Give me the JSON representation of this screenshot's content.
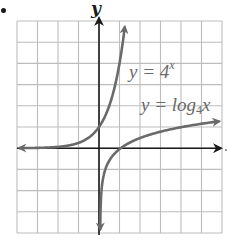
{
  "chart_data": {
    "type": "line",
    "title": "",
    "xlabel": "",
    "ylabel": "y",
    "xlim": [
      -4,
      6
    ],
    "ylim": [
      -4,
      6
    ],
    "grid": true,
    "grid_step": 1,
    "series": [
      {
        "name": "y = 4^x",
        "function": "4^x",
        "x": [
          -4,
          -3,
          -2,
          -1,
          -0.5,
          0,
          0.5,
          1,
          1.25,
          1.29
        ],
        "y": [
          0.0039,
          0.0156,
          0.0625,
          0.25,
          0.5,
          1,
          2,
          4,
          5.66,
          6
        ],
        "arrows": "both",
        "color": "#6a6a6a"
      },
      {
        "name": "y = log4 x",
        "function": "log_4(x)",
        "x": [
          0.0039,
          0.0156,
          0.0625,
          0.25,
          0.5,
          1,
          2,
          4,
          6
        ],
        "y": [
          -4,
          -3,
          -2,
          -1,
          -0.5,
          0,
          0.5,
          1,
          1.29
        ],
        "arrows": "both",
        "color": "#6a6a6a"
      }
    ],
    "annotations": [
      {
        "text": "y = 4^x",
        "x": 1.5,
        "y": 3.5
      },
      {
        "text": "y = log4 x",
        "x": 2.1,
        "y": 1.9
      }
    ]
  },
  "labels": {
    "y_axis": "y",
    "curve1": {
      "prefix": "y = 4",
      "sup": "x"
    },
    "curve2": {
      "prefix": "y = log",
      "sub": "4",
      "suffix": "x"
    }
  },
  "colors": {
    "grid": "#bdbdbd",
    "axis": "#1a1a1a",
    "curve": "#6a6a6a"
  }
}
